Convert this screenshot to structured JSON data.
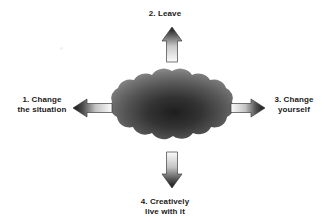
{
  "diagram": {
    "center": {
      "shape_name": "problem-cloud",
      "fill_center_color": "#262626",
      "fill_edge_color": "#8c8c8c"
    },
    "options": [
      {
        "id": "change-situation",
        "number": "1.",
        "label": "1. Change\nthe situation",
        "direction": "left",
        "arrow_name": "arrow-left"
      },
      {
        "id": "leave",
        "number": "2.",
        "label": "2. Leave",
        "direction": "up",
        "arrow_name": "arrow-up"
      },
      {
        "id": "change-yourself",
        "number": "3.",
        "label": "3. Change\nyourself",
        "direction": "right",
        "arrow_name": "arrow-right"
      },
      {
        "id": "creatively-live-with-it",
        "number": "4.",
        "label": "4. Creatively\nlive with it",
        "direction": "down",
        "arrow_name": "arrow-down"
      }
    ],
    "colors": {
      "text": "#1a1a1a",
      "arrow_dark": "#1c1c1c",
      "arrow_light": "#f2f2f2",
      "arrow_outline": "#4d4d4d",
      "background": "#ffffff"
    }
  }
}
